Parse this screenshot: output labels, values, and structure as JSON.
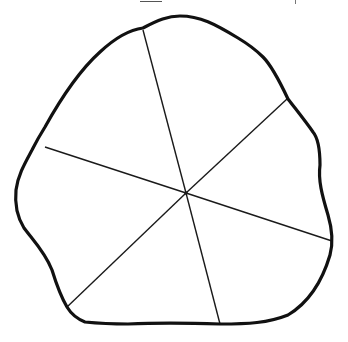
{
  "figure": {
    "colors": {
      "background": "#ffffff",
      "outline": "#111111",
      "spokes": "#1a1a1a"
    },
    "center": {
      "x": 186,
      "y": 193
    },
    "outline_path": "M180,16 C200,16 215,24 238,38 C248,44 255,49 263,57 C272,66 280,82 288,99 C298,112 306,122 313,132 C318,138 320,150 320,165 C318,180 322,195 328,215 C333,232 333,244 330,255 C322,282 308,303 288,315 C268,323 248,324 220,324 C190,323 150,323 128,324 C105,324 95,323 85,322 C75,318 70,312 67,307 C60,295 56,283 52,270 C45,252 33,240 24,228 C16,215 15,200 16,190 C18,175 25,163 32,150 C36,142 40,135 45,127 C60,100 80,70 100,52 C115,38 128,30 143,28 C158,20 168,16 180,16 Z",
    "spokes": [
      {
        "name": "spoke-top",
        "x2": 143,
        "y2": 30
      },
      {
        "name": "spoke-top-right",
        "x2": 287,
        "y2": 99
      },
      {
        "name": "spoke-right",
        "x2": 332,
        "y2": 241
      },
      {
        "name": "spoke-bottom",
        "x2": 220,
        "y2": 324
      },
      {
        "name": "spoke-bottom-left",
        "x2": 67,
        "y2": 307
      },
      {
        "name": "spoke-left",
        "x2": 45,
        "y2": 147
      }
    ],
    "sector_count": 6
  }
}
